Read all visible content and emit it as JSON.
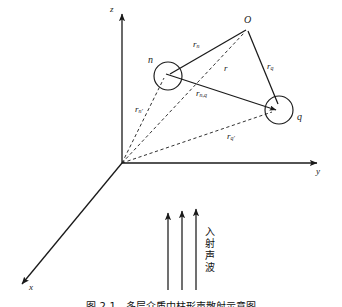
{
  "figure": {
    "title_caption": "图 2-1　多层介质中柱形声散射示意图",
    "axes": [
      {
        "name": "z-axis",
        "label": "z"
      },
      {
        "name": "y-axis",
        "label": "y"
      },
      {
        "name": "x-axis",
        "label": "x"
      }
    ],
    "points": [
      {
        "name": "origin-point",
        "label": "O",
        "role": "reference-point-O"
      },
      {
        "name": "scatterer-n",
        "label": "n",
        "role": "cylinder-n"
      },
      {
        "name": "scatterer-q",
        "label": "q",
        "role": "cylinder-q"
      }
    ],
    "vectors": [
      {
        "name": "r-n",
        "base": "r",
        "sub": "n",
        "style": "solid",
        "desc": "O to n"
      },
      {
        "name": "r-q",
        "base": "r",
        "sub": "q",
        "style": "solid",
        "desc": "O to q"
      },
      {
        "name": "r-nq",
        "base": "r",
        "sub": "n,q",
        "style": "solid",
        "desc": "n to q"
      },
      {
        "name": "r",
        "base": "r",
        "sub": "",
        "style": "dashed",
        "desc": "origin to O"
      },
      {
        "name": "r-np",
        "base": "r",
        "sub": "n'",
        "style": "dashed",
        "desc": "origin to n"
      },
      {
        "name": "r-qp",
        "base": "r",
        "sub": "q'",
        "style": "dashed",
        "desc": "origin to q"
      }
    ],
    "incident_wave": {
      "label": "入射声波",
      "arrow_count": 3,
      "direction": "up"
    },
    "colors": {
      "line": "#1a1a1a",
      "background": "#ffffff",
      "text": "#111111"
    }
  }
}
